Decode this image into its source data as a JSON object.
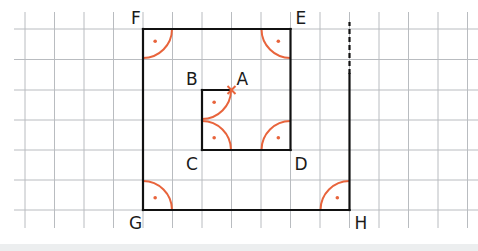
{
  "diagram": {
    "type": "geometric-construction-on-grid",
    "colors": {
      "grid": "#b9bcc0",
      "lines": "#111111",
      "right_angle_marks": "#e8643c",
      "background": "#ffffff",
      "bottom_band": "#eceeef"
    },
    "grid": {
      "x_lines": [
        25,
        54.5,
        84,
        113.5,
        143,
        172.5,
        202,
        231.5,
        261,
        290.5,
        320,
        349.5,
        379,
        408.5,
        438,
        467.5
      ],
      "y_lines": [
        29,
        59.5,
        90,
        120,
        150,
        180,
        210
      ],
      "x_extent": [
        14,
        478
      ],
      "y_extent": [
        12,
        228
      ]
    },
    "points": [
      {
        "name": "F",
        "x": 143,
        "y": 29,
        "label_dx": -12,
        "label_dy": -5
      },
      {
        "name": "E",
        "x": 290.5,
        "y": 29,
        "label_dx": 5,
        "label_dy": -5
      },
      {
        "name": "G",
        "x": 143,
        "y": 210,
        "label_dx": -14,
        "label_dy": 19
      },
      {
        "name": "H",
        "x": 349.5,
        "y": 210,
        "label_dx": 5,
        "label_dy": 19
      },
      {
        "name": "B",
        "x": 202,
        "y": 90,
        "label_dx": -16,
        "label_dy": -5
      },
      {
        "name": "A",
        "x": 231.5,
        "y": 90,
        "label_dx": 5,
        "label_dy": -5
      },
      {
        "name": "C",
        "x": 202,
        "y": 150,
        "label_dx": -16,
        "label_dy": 20
      },
      {
        "name": "D",
        "x": 290.5,
        "y": 150,
        "label_dx": 4,
        "label_dy": 20
      }
    ],
    "labels": {
      "F": "F",
      "E": "E",
      "G": "G",
      "H": "H",
      "B": "B",
      "A": "A",
      "C": "C",
      "D": "D"
    },
    "segments": [
      {
        "from": "F",
        "to": "E",
        "style": "solid"
      },
      {
        "from": "E",
        "to": "D",
        "style": "solid"
      },
      {
        "from": "D",
        "to": "C",
        "style": "solid"
      },
      {
        "from": "C",
        "to": "B",
        "style": "solid"
      },
      {
        "from": "B",
        "to": "A",
        "style": "solid"
      },
      {
        "from": "F",
        "to": "G",
        "style": "solid"
      },
      {
        "from": "G",
        "to": "H",
        "style": "solid"
      },
      {
        "from": "H",
        "to": "top",
        "style": "solid",
        "x": 349.5,
        "y1": 210,
        "y2": 74
      },
      {
        "from": "top",
        "to": "open",
        "style": "dashed",
        "x": 349.5,
        "y1": 74,
        "y2": 22
      }
    ],
    "right_angles": [
      {
        "at": "F",
        "cx": 143,
        "cy": 29,
        "dir": "down-right"
      },
      {
        "at": "E",
        "cx": 290.5,
        "cy": 29,
        "dir": "down-left"
      },
      {
        "at": "G",
        "cx": 143,
        "cy": 210,
        "dir": "up-right"
      },
      {
        "at": "H",
        "cx": 349.5,
        "cy": 210,
        "dir": "up-left"
      },
      {
        "at": "B",
        "cx": 202,
        "cy": 90,
        "dir": "down-right"
      },
      {
        "at": "C",
        "cx": 202,
        "cy": 150,
        "dir": "up-right"
      },
      {
        "at": "D",
        "cx": 290.5,
        "cy": 150,
        "dir": "up-left"
      }
    ],
    "arc_radius": 29,
    "marker": {
      "at": "A",
      "type": "cross",
      "x": 231.5,
      "y": 90
    }
  }
}
